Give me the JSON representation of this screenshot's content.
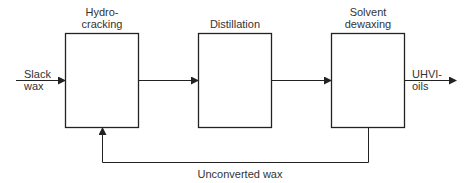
{
  "diagram": {
    "nodes": [
      {
        "id": "hydrocracking",
        "label_line1": "Hydro-",
        "label_line2": "cracking"
      },
      {
        "id": "distillation",
        "label_line1": "Distillation"
      },
      {
        "id": "solvent_dewaxing",
        "label_line1": "Solvent",
        "label_line2": "dewaxing"
      }
    ],
    "input": {
      "label_line1": "Slack",
      "label_line2": "wax"
    },
    "output": {
      "label_line1": "UHVI-",
      "label_line2": "oils"
    },
    "recycle": {
      "label": "Unconverted wax"
    },
    "edges": [
      {
        "from": "input",
        "to": "hydrocracking"
      },
      {
        "from": "hydrocracking",
        "to": "distillation"
      },
      {
        "from": "distillation",
        "to": "solvent_dewaxing"
      },
      {
        "from": "solvent_dewaxing",
        "to": "output"
      },
      {
        "from": "solvent_dewaxing",
        "to": "hydrocracking",
        "label": "Unconverted wax"
      }
    ],
    "colors": {
      "stroke": "#222222",
      "background": "#ffffff"
    }
  }
}
